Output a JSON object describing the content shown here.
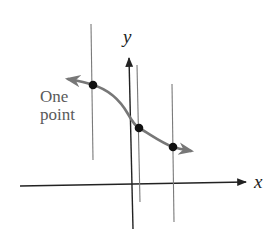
{
  "diagram": {
    "title": "",
    "axes": {
      "x_label": "x",
      "y_label": "y"
    },
    "annotation": {
      "line1": "One",
      "line2": "point"
    },
    "curve": {
      "description": "decreasing S-shaped curve with arrowheads at both ends",
      "color": "#777777"
    },
    "vertical_lines": [
      {
        "id": "left",
        "intersections": 1
      },
      {
        "id": "middle",
        "intersections": 1
      },
      {
        "id": "right",
        "intersections": 1
      }
    ],
    "points": [
      {
        "id": "p1",
        "on": "left-line"
      },
      {
        "id": "p2",
        "on": "middle-line"
      },
      {
        "id": "p3",
        "on": "right-line"
      }
    ],
    "colors": {
      "axis": "#222222",
      "vertical_line": "#7a7a7a",
      "curve": "#777777",
      "point": "#111111",
      "text": "#5a5a5a"
    }
  }
}
